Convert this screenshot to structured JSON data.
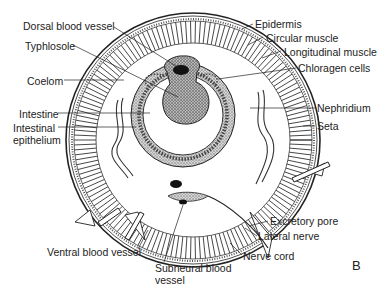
{
  "diagram": {
    "panel_letter": "B",
    "labels": {
      "dorsal_blood_vessel": "Dorsal blood vessel",
      "typhlosole": "Typhlosole",
      "coelom": "Coelom",
      "intestine": "Intestine",
      "intestinal_epithelium_1": "Intestinal",
      "intestinal_epithelium_2": "epithelium",
      "epidermis": "Epidermis",
      "circular_muscle": "Circular muscle",
      "longitudinal_muscle": "Longitudinal muscle",
      "chloragen_cells": "Chloragen cells",
      "nephridium": "Nephridium",
      "seta": "Seta",
      "excretory_pore": "Excretory pore",
      "lateral_nerve": "Lateral nerve",
      "nerve_cord": "Nerve cord",
      "ventral_blood_vessel": "Ventral blood vessel",
      "subneural_blood_vessel_1": "Subneural blood",
      "subneural_blood_vessel_2": "vessel"
    },
    "colors": {
      "ink": "#222222",
      "background": "#ffffff",
      "stipple": "#8a8a8a"
    }
  }
}
